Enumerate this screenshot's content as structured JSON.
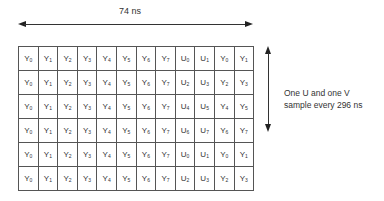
{
  "top_arrow": {
    "label": "74 ns"
  },
  "side_arrow": {
    "label_line1": "One U and one V",
    "label_line2": "sample every 296 ns"
  },
  "grid": {
    "rows": [
      [
        [
          "Y",
          "0"
        ],
        [
          "Y",
          "1"
        ],
        [
          "Y",
          "2"
        ],
        [
          "Y",
          "3"
        ],
        [
          "Y",
          "4"
        ],
        [
          "Y",
          "5"
        ],
        [
          "Y",
          "6"
        ],
        [
          "Y",
          "7"
        ],
        [
          "U",
          "0"
        ],
        [
          "U",
          "1"
        ],
        [
          "Y",
          "0"
        ],
        [
          "Y",
          "1"
        ]
      ],
      [
        [
          "Y",
          "0"
        ],
        [
          "Y",
          "1"
        ],
        [
          "Y",
          "2"
        ],
        [
          "Y",
          "3"
        ],
        [
          "Y",
          "4"
        ],
        [
          "Y",
          "5"
        ],
        [
          "Y",
          "6"
        ],
        [
          "Y",
          "7"
        ],
        [
          "U",
          "2"
        ],
        [
          "U",
          "3"
        ],
        [
          "Y",
          "2"
        ],
        [
          "Y",
          "3"
        ]
      ],
      [
        [
          "Y",
          "0"
        ],
        [
          "Y",
          "1"
        ],
        [
          "Y",
          "2"
        ],
        [
          "Y",
          "3"
        ],
        [
          "Y",
          "4"
        ],
        [
          "Y",
          "5"
        ],
        [
          "Y",
          "6"
        ],
        [
          "Y",
          "7"
        ],
        [
          "U",
          "4"
        ],
        [
          "U",
          "5"
        ],
        [
          "Y",
          "4"
        ],
        [
          "Y",
          "5"
        ]
      ],
      [
        [
          "Y",
          "0"
        ],
        [
          "Y",
          "1"
        ],
        [
          "Y",
          "2"
        ],
        [
          "Y",
          "3"
        ],
        [
          "Y",
          "4"
        ],
        [
          "Y",
          "5"
        ],
        [
          "Y",
          "6"
        ],
        [
          "Y",
          "7"
        ],
        [
          "U",
          "6"
        ],
        [
          "U",
          "7"
        ],
        [
          "Y",
          "6"
        ],
        [
          "Y",
          "7"
        ]
      ],
      [
        [
          "Y",
          "0"
        ],
        [
          "Y",
          "1"
        ],
        [
          "Y",
          "2"
        ],
        [
          "Y",
          "3"
        ],
        [
          "Y",
          "4"
        ],
        [
          "Y",
          "5"
        ],
        [
          "Y",
          "6"
        ],
        [
          "Y",
          "7"
        ],
        [
          "U",
          "0"
        ],
        [
          "U",
          "1"
        ],
        [
          "Y",
          "0"
        ],
        [
          "Y",
          "1"
        ]
      ],
      [
        [
          "Y",
          "0"
        ],
        [
          "Y",
          "1"
        ],
        [
          "Y",
          "2"
        ],
        [
          "Y",
          "3"
        ],
        [
          "Y",
          "4"
        ],
        [
          "Y",
          "5"
        ],
        [
          "Y",
          "6"
        ],
        [
          "Y",
          "7"
        ],
        [
          "U",
          "2"
        ],
        [
          "U",
          "3"
        ],
        [
          "Y",
          "2"
        ],
        [
          "Y",
          "3"
        ]
      ]
    ]
  }
}
